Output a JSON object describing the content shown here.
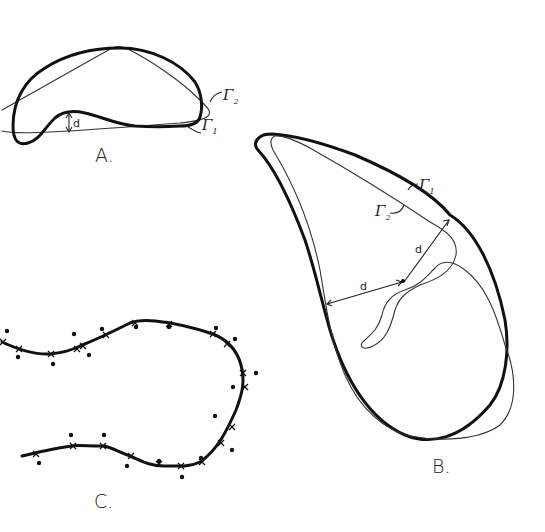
{
  "figure": {
    "panels": [
      {
        "id": "A",
        "label": "A.",
        "curves": [
          {
            "name": "Γ1",
            "symbol": "Γ",
            "subscript": "1",
            "style": "thick"
          },
          {
            "name": "Γ2",
            "symbol": "Γ",
            "subscript": "2",
            "style": "thin"
          }
        ],
        "distance_label": "d"
      },
      {
        "id": "B",
        "label": "B.",
        "curves": [
          {
            "name": "Γ1",
            "symbol": "Γ",
            "subscript": "1",
            "style": "thick"
          },
          {
            "name": "Γ2",
            "symbol": "Γ",
            "subscript": "2",
            "style": "thin"
          }
        ],
        "distance_labels": [
          "d",
          "d"
        ]
      },
      {
        "id": "C",
        "label": "C.",
        "description": "Thick curve with sample points marked by crosses and scattered dots around it",
        "cross_marker_count": 22,
        "dot_marker_count": 22
      }
    ]
  },
  "labels": {
    "A": "A.",
    "B": "B.",
    "C": "C.",
    "gamma": "Γ",
    "sub1": "1",
    "sub2": "2",
    "d": "d"
  }
}
